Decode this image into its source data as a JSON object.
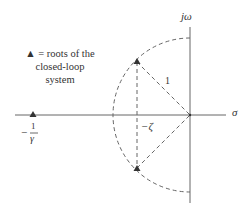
{
  "diagram": {
    "type": "s-plane root locus sketch",
    "axes": {
      "horizontal_label": "σ",
      "vertical_label": "jω"
    },
    "legend": {
      "symbol": "▲",
      "line1": "▲ = roots of the",
      "line2": "closed-loop",
      "line3": "system"
    },
    "labels": {
      "radius": "1",
      "damping": "−ζ",
      "pole_real_minus": "−",
      "pole_real_num": "1",
      "pole_real_den": "γ"
    },
    "elements": [
      {
        "id": "unit-circle-arc",
        "style": "dashed",
        "description": "semicircle of radius 1 in left half plane"
      },
      {
        "id": "complex-pole-upper",
        "marker": "triangle"
      },
      {
        "id": "complex-pole-lower",
        "marker": "triangle"
      },
      {
        "id": "real-pole",
        "marker": "triangle",
        "location": "-1/γ"
      }
    ],
    "colors": {
      "line": "#555555",
      "dash": "#666666",
      "marker": "#333333"
    }
  }
}
